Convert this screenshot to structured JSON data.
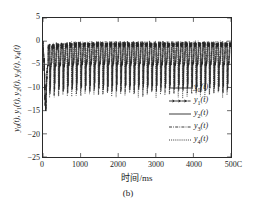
{
  "figure": {
    "caption": "(b)"
  },
  "chart_data": {
    "type": "line",
    "title": "",
    "xlabel_cn": "时间",
    "xlabel_unit": "/ms",
    "ylabel_parts": [
      "y",
      "0",
      "(t), ",
      "y",
      "1",
      "(t), ",
      "y",
      "2",
      "(t), ",
      "y",
      "3",
      "(t), ",
      "y",
      "4",
      "(t)"
    ],
    "ylabel_plain": "y0(t), y1(t), y2(t), y3(t), y4(t)",
    "xlim": [
      0,
      5000
    ],
    "ylim": [
      -25,
      5
    ],
    "xticks": [
      0,
      1000,
      2000,
      3000,
      4000,
      5000
    ],
    "xtick_labels": [
      "0",
      "1000",
      "2000",
      "3000",
      "4000",
      "500C"
    ],
    "yticks": [
      5,
      0,
      -5,
      -10,
      -15,
      -20,
      -25
    ],
    "ytick_labels": [
      "5",
      "0",
      "-5",
      "-10",
      "-15",
      "-20",
      "-25"
    ],
    "grid": false,
    "legend_position": "center right",
    "series": [
      {
        "name": "y0(t)",
        "sub": "0",
        "style": "solid",
        "color": "#262626"
      },
      {
        "name": "y1(t)",
        "sub": "1",
        "style": "dashdot-marker",
        "color": "#262626"
      },
      {
        "name": "y2(t)",
        "sub": "2",
        "style": "solid",
        "color": "#262626"
      },
      {
        "name": "y3(t)",
        "sub": "3",
        "style": "dashdot",
        "color": "#262626"
      },
      {
        "name": "y4(t)",
        "sub": "4",
        "style": "dotted",
        "color": "#262626"
      }
    ],
    "transient": {
      "t_ms": 60,
      "min_value": -22
    },
    "steady_state": {
      "baseline": -5,
      "peak_top": 0,
      "trough_range": [
        -10,
        -6
      ],
      "spike_period_ms": 118
    }
  }
}
